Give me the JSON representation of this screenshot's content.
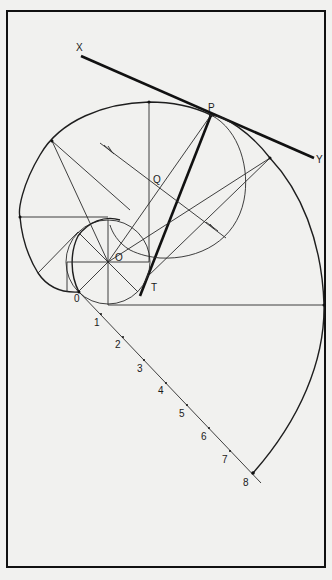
{
  "diagram": {
    "type": "technical-drawing",
    "labels": {
      "x": "X",
      "y": "Y",
      "p": "P",
      "q": "Q",
      "o_center": "O",
      "t": "T",
      "scale_0": "0",
      "scale_1": "1",
      "scale_2": "2",
      "scale_3": "3",
      "scale_4": "4",
      "scale_5": "5",
      "scale_6": "6",
      "scale_7": "7",
      "scale_8": "8"
    },
    "colors": {
      "background": "#f1f1ef",
      "ink": "#111111"
    }
  }
}
